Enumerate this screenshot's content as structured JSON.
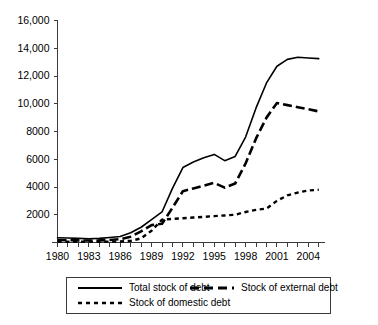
{
  "chart_data": {
    "type": "line",
    "title": "",
    "subtitle": "",
    "xlabel": "",
    "ylabel": "",
    "xlim": [
      1980,
      2005
    ],
    "ylim": [
      0,
      16000
    ],
    "grid": false,
    "legend_position": "bottom",
    "x": [
      1980,
      1981,
      1982,
      1983,
      1984,
      1985,
      1986,
      1987,
      1988,
      1989,
      1990,
      1991,
      1992,
      1993,
      1994,
      1995,
      1996,
      1997,
      1998,
      1999,
      2000,
      2001,
      2002,
      2003,
      2004,
      2005
    ],
    "xticklabels": [
      "1980",
      "1983",
      "1986",
      "1989",
      "1992",
      "1995",
      "1998",
      "2001",
      "2004"
    ],
    "xtickvalues": [
      1980,
      1983,
      1986,
      1989,
      1992,
      1995,
      1998,
      2001,
      2004
    ],
    "yticklabels": [
      "16,000",
      "14,000",
      "12,000",
      "10,000",
      "8000",
      "6000",
      "4000",
      "2000",
      ""
    ],
    "ytickvalues": [
      16000,
      14000,
      12000,
      10000,
      8000,
      6000,
      4000,
      2000,
      0
    ],
    "series": [
      {
        "name": "Total stock of debt",
        "style": "solid",
        "values": [
          340,
          320,
          300,
          270,
          300,
          360,
          430,
          700,
          1100,
          1650,
          2200,
          3900,
          5400,
          5800,
          6100,
          6350,
          5900,
          6200,
          7600,
          9700,
          11500,
          12700,
          13200,
          13350,
          13300,
          13250
        ]
      },
      {
        "name": "Stock of external debt",
        "style": "dashed",
        "values": [
          180,
          160,
          150,
          140,
          150,
          180,
          240,
          420,
          800,
          1250,
          1350,
          2500,
          3700,
          3900,
          4100,
          4300,
          3950,
          4250,
          5700,
          7500,
          9000,
          10050,
          9900,
          9750,
          9600,
          9450
        ]
      },
      {
        "name": "Stock of domestic debt",
        "style": "dotted",
        "values": [
          60,
          55,
          50,
          50,
          55,
          60,
          70,
          120,
          300,
          850,
          1650,
          1700,
          1750,
          1800,
          1850,
          1900,
          1950,
          2000,
          2200,
          2350,
          2450,
          3000,
          3400,
          3600,
          3750,
          3800
        ]
      }
    ]
  },
  "legend": {
    "items": [
      {
        "label": "Total stock of debt",
        "style": "solid"
      },
      {
        "label": "Stock of external debt",
        "style": "dashed"
      },
      {
        "label": "Stock of domestic debt",
        "style": "dotted"
      }
    ]
  }
}
